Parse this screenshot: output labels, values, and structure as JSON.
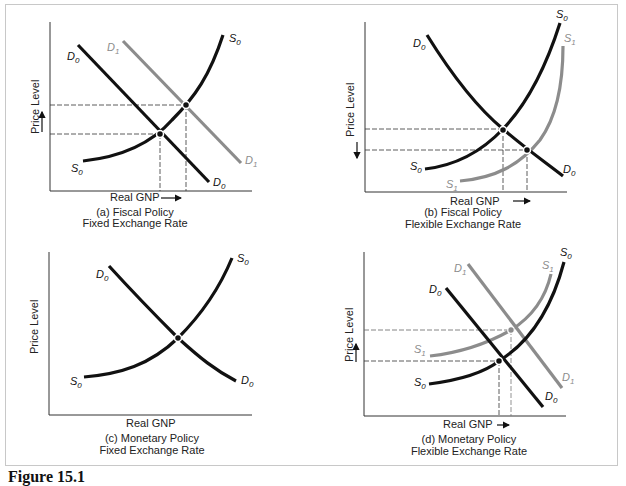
{
  "figure_caption": "Figure 15.1",
  "axis_labels": {
    "y": "Price Level",
    "x": "Real GNP"
  },
  "panels": [
    {
      "id": "a",
      "caption_line1": "(a) Fiscal Policy",
      "caption_line2": "Fixed Exchange Rate",
      "y_arrow": "up",
      "x_arrow": true,
      "curves": [
        "D0",
        "D1",
        "S0"
      ],
      "labels": {
        "d0": "D",
        "d1": "D",
        "s0": "S",
        "s1": "S",
        "sub0": "0",
        "sub1": "1"
      }
    },
    {
      "id": "b",
      "caption_line1": "(b) Fiscal Policy",
      "caption_line2": "Flexible Exchange Rate",
      "y_arrow": "down",
      "x_arrow": true,
      "curves": [
        "D0",
        "S0",
        "S1"
      ]
    },
    {
      "id": "c",
      "caption_line1": "(c) Monetary Policy",
      "caption_line2": "Fixed Exchange Rate",
      "y_arrow": "none",
      "x_arrow": false,
      "curves": [
        "D0",
        "S0"
      ]
    },
    {
      "id": "d",
      "caption_line1": "(d) Monetary Policy",
      "caption_line2": "Flexible Exchange Rate",
      "y_arrow": "up",
      "x_arrow": true,
      "curves": [
        "D0",
        "D1",
        "S0",
        "S1"
      ]
    }
  ],
  "curve_letters": {
    "D": "D",
    "S": "S",
    "sub0": "0",
    "sub1": "1"
  },
  "colors": {
    "primary_curve": "#111111",
    "shifted_curve": "#8c8c8c",
    "frame": "#c8c8c8",
    "text": "#222222"
  }
}
